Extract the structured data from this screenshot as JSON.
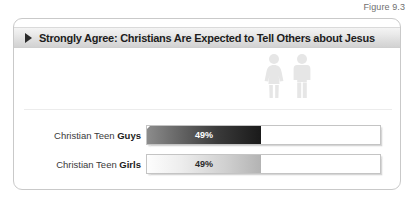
{
  "figure": {
    "label": "Figure 9.3"
  },
  "card": {
    "header": {
      "arrow_icon": "triangle-right-icon",
      "title": "Strongly Agree: Christians Are Expected to Tell Others about Jesus"
    },
    "icons": [
      {
        "name": "female-figure-icon"
      },
      {
        "name": "male-figure-icon"
      }
    ]
  },
  "chart_data": {
    "type": "bar",
    "title": "Strongly Agree: Christians Are Expected to Tell Others about Jesus",
    "categories": [
      "Christian Teen Guys",
      "Christian Teen Girls"
    ],
    "values": [
      49,
      49
    ],
    "value_labels": [
      "49%",
      "49%"
    ],
    "xlabel": "",
    "ylabel": "",
    "xlim": [
      0,
      100
    ],
    "grid": false,
    "legend": "none",
    "orientation": "horizontal",
    "rows": [
      {
        "label_prefix": "Christian Teen ",
        "label_emphasis": "Guys",
        "value": 49,
        "value_label": "49%",
        "fill_style": "dark-gradient"
      },
      {
        "label_prefix": "Christian Teen ",
        "label_emphasis": "Girls",
        "value": 49,
        "value_label": "49%",
        "fill_style": "light-gradient"
      }
    ]
  }
}
